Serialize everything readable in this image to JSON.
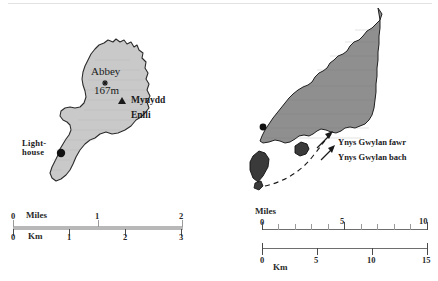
{
  "figure": {
    "name": "bardsey-island-and-lleyn-peninsula-maps",
    "panels": [
      "left-inset-bardsey-island",
      "right-inset-lleyn-peninsula"
    ]
  },
  "left_map": {
    "name": "Bardsey Island",
    "labels": {
      "abbey": "Abbey",
      "summit_height": "167m",
      "mountain_line1": "Mynydd",
      "mountain_line2": "Enlli",
      "lighthouse_line1": "Light-",
      "lighthouse_line2": "house"
    },
    "markers": {
      "abbey_marker": "star-marker",
      "summit_marker": "triangle-marker",
      "lighthouse_marker": "dot-marker"
    },
    "fill_color": "#c9c9c9",
    "outline_color": "#2b2b2b"
  },
  "right_map": {
    "name": "Lleyn Peninsula",
    "labels": {
      "town": "Aberdaron",
      "island_large": "Ynys Gwylan fawr",
      "island_small": "Ynys Gwylan bach"
    },
    "markers": {
      "town_marker": "dot-marker",
      "island_large_marker": "arrow-pointer",
      "island_small_marker": "arrow-pointer",
      "boat_route": "dashed-line"
    },
    "fill_color": "#8f8f8f",
    "island_fill_color": "#3a3a3a",
    "outline_color": "#1f1f1f"
  },
  "left_scale": {
    "miles": {
      "unit": "Miles",
      "ticks": [
        "0",
        "1",
        "2"
      ],
      "values": [
        0,
        1,
        2
      ]
    },
    "km": {
      "unit": "Km",
      "ticks": [
        "0",
        "1",
        "2",
        "3"
      ],
      "values": [
        0,
        1,
        2,
        3
      ]
    },
    "bar_color": "#b8b8b8"
  },
  "right_scale": {
    "miles": {
      "unit": "Miles",
      "ticks": [
        "0",
        "5",
        "10"
      ],
      "values": [
        0,
        5,
        10
      ],
      "minor_tick_interval": 1
    },
    "km": {
      "unit": "Km",
      "ticks": [
        "0",
        "5",
        "10",
        "15"
      ],
      "values": [
        0,
        5,
        10,
        15
      ]
    },
    "bar_color": "#9a9a9a"
  }
}
